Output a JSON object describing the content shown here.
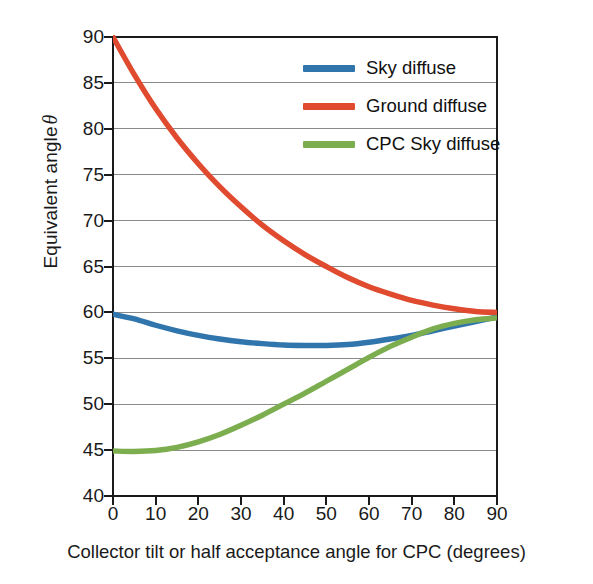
{
  "chart_data": {
    "type": "line",
    "title": "",
    "xlabel": "Collector tilt or half acceptance angle for CPC (degrees)",
    "ylabel": "Equivalent angle θ",
    "ylabel_text": "Equivalent angle",
    "ylabel_symbol": "θ",
    "xlim": [
      0,
      90
    ],
    "ylim": [
      40,
      90
    ],
    "xticks": [
      0,
      10,
      20,
      30,
      40,
      50,
      60,
      70,
      80,
      90
    ],
    "yticks": [
      40,
      45,
      50,
      55,
      60,
      65,
      70,
      75,
      80,
      85,
      90
    ],
    "grid": "horizontal",
    "grid_color": "#8a8a8a",
    "legend_position": "upper-right-inside",
    "x": [
      0,
      5,
      10,
      15,
      20,
      25,
      30,
      35,
      40,
      45,
      50,
      55,
      60,
      65,
      70,
      75,
      80,
      85,
      90
    ],
    "series": [
      {
        "name": "Sky diffuse",
        "color": "#3175ad",
        "values": [
          59.8,
          59.3,
          58.6,
          58.0,
          57.5,
          57.1,
          56.8,
          56.6,
          56.45,
          56.4,
          56.4,
          56.5,
          56.75,
          57.1,
          57.5,
          58.0,
          58.5,
          59.0,
          59.5
        ]
      },
      {
        "name": "Ground diffuse",
        "color": "#e04a2f",
        "values": [
          90.0,
          85.9,
          82.2,
          79.0,
          76.2,
          73.7,
          71.5,
          69.5,
          67.8,
          66.3,
          65.0,
          63.8,
          62.8,
          62.0,
          61.3,
          60.8,
          60.4,
          60.1,
          60.0
        ]
      },
      {
        "name": "CPC Sky diffuse",
        "color": "#7cae50",
        "values": [
          44.9,
          44.85,
          44.95,
          45.3,
          45.9,
          46.7,
          47.7,
          48.8,
          50.0,
          51.2,
          52.5,
          53.8,
          55.1,
          56.3,
          57.3,
          58.2,
          58.8,
          59.2,
          59.4
        ]
      }
    ]
  },
  "legend": {
    "items": [
      {
        "label": "Sky diffuse",
        "color": "#3175ad"
      },
      {
        "label": "Ground diffuse",
        "color": "#e04a2f"
      },
      {
        "label": "CPC Sky diffuse",
        "color": "#7cae50"
      }
    ]
  },
  "axes": {
    "x_title": "Collector tilt or half acceptance angle for CPC (degrees)",
    "y_title_text": "Equivalent angle",
    "y_title_symbol": "θ"
  }
}
